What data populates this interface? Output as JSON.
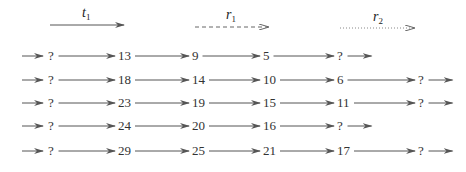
{
  "legend": [
    {
      "symbol": "t",
      "subscript": "1",
      "line_style": "solid"
    },
    {
      "symbol": "r",
      "subscript": "1",
      "line_style": "dashed"
    },
    {
      "symbol": "r",
      "subscript": "2",
      "line_style": "dotted"
    }
  ],
  "rows": [
    [
      "?",
      "13",
      "9",
      "5",
      "?"
    ],
    [
      "?",
      "18",
      "14",
      "10",
      "6",
      "?"
    ],
    [
      "?",
      "23",
      "19",
      "15",
      "11",
      "?"
    ],
    [
      "?",
      "24",
      "20",
      "16",
      "?"
    ],
    [
      "?",
      "29",
      "25",
      "21",
      "17",
      "?"
    ]
  ],
  "colors": {
    "line": "#555555",
    "text": "#333333"
  }
}
